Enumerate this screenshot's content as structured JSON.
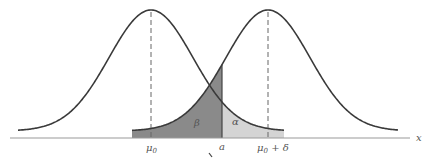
{
  "diagram": {
    "type": "overlapping-normal-distributions",
    "axis": {
      "label": "x"
    },
    "ticks": [
      {
        "id": "mu0",
        "label_main": "μ",
        "label_sub": "0",
        "label_suffix": ""
      },
      {
        "id": "a",
        "label_main": "a",
        "label_sub": "",
        "label_suffix": ""
      },
      {
        "id": "mu0_delta",
        "label_main": "μ",
        "label_sub": "0",
        "label_suffix": " + δ"
      }
    ],
    "regions": [
      {
        "id": "beta",
        "label": "β",
        "color": "#8a8a8a"
      },
      {
        "id": "alpha",
        "label": "α",
        "color": "#d4d4d4"
      }
    ],
    "colors": {
      "curve": "#3a3a3a",
      "axis": "#999999",
      "dashed": "#666666"
    }
  }
}
